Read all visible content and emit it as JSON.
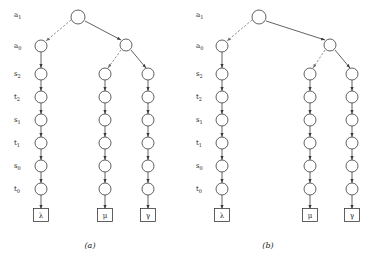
{
  "figure": {
    "panels": [
      {
        "id": "panel-a",
        "caption": "(a)",
        "caption_x": 90,
        "caption_y": 248,
        "origin_x": 0,
        "row_labels": [
          {
            "base": "a",
            "sub": "1",
            "x": 14,
            "y": 17
          },
          {
            "base": "a",
            "sub": "0",
            "x": 14,
            "y": 48
          },
          {
            "base": "s",
            "sub": "2",
            "x": 14,
            "y": 76
          },
          {
            "base": "t",
            "sub": "2",
            "x": 14,
            "y": 99
          },
          {
            "base": "s",
            "sub": "1",
            "x": 14,
            "y": 122
          },
          {
            "base": "t",
            "sub": "1",
            "x": 14,
            "y": 145
          },
          {
            "base": "s",
            "sub": "0",
            "x": 14,
            "y": 168
          },
          {
            "base": "t",
            "sub": "0",
            "x": 14,
            "y": 191
          }
        ],
        "nodes": [
          {
            "name": "root-node",
            "x": 78,
            "y": 17,
            "r": 7
          },
          {
            "name": "left-a0-node",
            "x": 41,
            "y": 46,
            "r": 6
          },
          {
            "name": "right-a0-node",
            "x": 126,
            "y": 45,
            "r": 6
          },
          {
            "name": "left-chain-node-s2",
            "x": 41,
            "y": 74,
            "r": 6
          },
          {
            "name": "left-chain-node-t2",
            "x": 41,
            "y": 97,
            "r": 6
          },
          {
            "name": "left-chain-node-s1",
            "x": 41,
            "y": 120,
            "r": 6
          },
          {
            "name": "left-chain-node-t1",
            "x": 41,
            "y": 143,
            "r": 6
          },
          {
            "name": "left-chain-node-s0",
            "x": 41,
            "y": 166,
            "r": 6
          },
          {
            "name": "left-chain-node-t0",
            "x": 41,
            "y": 189,
            "r": 6
          },
          {
            "name": "mid-chain-node-s2",
            "x": 105,
            "y": 74,
            "r": 6
          },
          {
            "name": "mid-chain-node-t2",
            "x": 105,
            "y": 97,
            "r": 6
          },
          {
            "name": "mid-chain-node-s1",
            "x": 105,
            "y": 120,
            "r": 6
          },
          {
            "name": "mid-chain-node-t1",
            "x": 105,
            "y": 143,
            "r": 6
          },
          {
            "name": "mid-chain-node-s0",
            "x": 105,
            "y": 166,
            "r": 6
          },
          {
            "name": "mid-chain-node-t0",
            "x": 105,
            "y": 189,
            "r": 6
          },
          {
            "name": "right-chain-node-s2",
            "x": 148,
            "y": 74,
            "r": 6
          },
          {
            "name": "right-chain-node-t2",
            "x": 148,
            "y": 97,
            "r": 6
          },
          {
            "name": "right-chain-node-s1",
            "x": 148,
            "y": 120,
            "r": 6
          },
          {
            "name": "right-chain-node-t1",
            "x": 148,
            "y": 143,
            "r": 6
          },
          {
            "name": "right-chain-node-s0",
            "x": 148,
            "y": 166,
            "r": 6
          },
          {
            "name": "right-chain-node-t0",
            "x": 148,
            "y": 189,
            "r": 6
          }
        ],
        "terminals": [
          {
            "name": "terminal-lambda",
            "label": "λ",
            "x": 41,
            "y": 215,
            "w": 15,
            "h": 13
          },
          {
            "name": "terminal-mu",
            "label": "μ",
            "x": 105,
            "y": 215,
            "w": 15,
            "h": 13
          },
          {
            "name": "terminal-gamma",
            "label": "γ",
            "x": 148,
            "y": 215,
            "w": 15,
            "h": 13
          }
        ],
        "edges": [
          {
            "name": "edge-root-to-left-a0",
            "style": "dashed",
            "x1": 71,
            "y1": 20,
            "x2": 46,
            "y2": 41
          },
          {
            "name": "edge-root-to-right-a0",
            "style": "solid",
            "x1": 85,
            "y1": 21,
            "x2": 121,
            "y2": 40
          },
          {
            "name": "edge-right-a0-to-mid",
            "style": "dashed",
            "x1": 121,
            "y1": 50,
            "x2": 108,
            "y2": 68
          },
          {
            "name": "edge-right-a0-to-right",
            "style": "solid",
            "x1": 131,
            "y1": 50,
            "x2": 146,
            "y2": 68
          }
        ],
        "chain_edges": [
          {
            "name": "chain-edge",
            "x": 41,
            "y1": 52,
            "y2": 68
          },
          {
            "name": "chain-edge",
            "x": 41,
            "y1": 80,
            "y2": 91
          },
          {
            "name": "chain-edge",
            "x": 41,
            "y1": 103,
            "y2": 114
          },
          {
            "name": "chain-edge",
            "x": 41,
            "y1": 126,
            "y2": 137
          },
          {
            "name": "chain-edge",
            "x": 41,
            "y1": 149,
            "y2": 160
          },
          {
            "name": "chain-edge",
            "x": 41,
            "y1": 172,
            "y2": 183
          },
          {
            "name": "chain-edge",
            "x": 41,
            "y1": 195,
            "y2": 209
          },
          {
            "name": "chain-edge",
            "x": 105,
            "y1": 80,
            "y2": 91
          },
          {
            "name": "chain-edge",
            "x": 105,
            "y1": 103,
            "y2": 114
          },
          {
            "name": "chain-edge",
            "x": 105,
            "y1": 126,
            "y2": 137
          },
          {
            "name": "chain-edge",
            "x": 105,
            "y1": 149,
            "y2": 160
          },
          {
            "name": "chain-edge",
            "x": 105,
            "y1": 172,
            "y2": 183
          },
          {
            "name": "chain-edge",
            "x": 105,
            "y1": 195,
            "y2": 209
          },
          {
            "name": "chain-edge",
            "x": 148,
            "y1": 80,
            "y2": 91
          },
          {
            "name": "chain-edge",
            "x": 148,
            "y1": 103,
            "y2": 114
          },
          {
            "name": "chain-edge",
            "x": 148,
            "y1": 126,
            "y2": 137
          },
          {
            "name": "chain-edge",
            "x": 148,
            "y1": 149,
            "y2": 160
          },
          {
            "name": "chain-edge",
            "x": 148,
            "y1": 172,
            "y2": 183
          },
          {
            "name": "chain-edge",
            "x": 148,
            "y1": 195,
            "y2": 209
          }
        ]
      },
      {
        "id": "panel-b",
        "caption": "(b)",
        "caption_x": 268,
        "caption_y": 248,
        "origin_x": 186,
        "row_labels": [
          {
            "base": "a",
            "sub": "1",
            "x": 196,
            "y": 17
          },
          {
            "base": "a",
            "sub": "0",
            "x": 196,
            "y": 48
          },
          {
            "base": "s",
            "sub": "2",
            "x": 196,
            "y": 76
          },
          {
            "base": "t",
            "sub": "2",
            "x": 196,
            "y": 99
          },
          {
            "base": "s",
            "sub": "1",
            "x": 196,
            "y": 122
          },
          {
            "base": "t",
            "sub": "1",
            "x": 196,
            "y": 145
          },
          {
            "base": "s",
            "sub": "0",
            "x": 196,
            "y": 168
          },
          {
            "base": "t",
            "sub": "0",
            "x": 196,
            "y": 191
          }
        ],
        "nodes": [
          {
            "name": "root-node",
            "x": 259,
            "y": 17,
            "r": 7
          },
          {
            "name": "left-a0-node",
            "x": 222,
            "y": 46,
            "r": 6
          },
          {
            "name": "right-a0-node",
            "x": 330,
            "y": 45,
            "r": 6
          },
          {
            "name": "left-chain-node-s2",
            "x": 222,
            "y": 74,
            "r": 6
          },
          {
            "name": "left-chain-node-t2",
            "x": 222,
            "y": 97,
            "r": 6
          },
          {
            "name": "left-chain-node-s1",
            "x": 222,
            "y": 120,
            "r": 6
          },
          {
            "name": "left-chain-node-t1",
            "x": 222,
            "y": 143,
            "r": 6
          },
          {
            "name": "left-chain-node-s0",
            "x": 222,
            "y": 166,
            "r": 6
          },
          {
            "name": "left-chain-node-t0",
            "x": 222,
            "y": 189,
            "r": 6
          },
          {
            "name": "mid-chain-node-s2",
            "x": 310,
            "y": 74,
            "r": 6
          },
          {
            "name": "mid-chain-node-t2",
            "x": 310,
            "y": 97,
            "r": 6
          },
          {
            "name": "mid-chain-node-s1",
            "x": 310,
            "y": 120,
            "r": 6
          },
          {
            "name": "mid-chain-node-t1",
            "x": 310,
            "y": 143,
            "r": 6
          },
          {
            "name": "mid-chain-node-s0",
            "x": 310,
            "y": 166,
            "r": 6
          },
          {
            "name": "mid-chain-node-t0",
            "x": 310,
            "y": 189,
            "r": 6
          },
          {
            "name": "right-chain-node-s2",
            "x": 352,
            "y": 74,
            "r": 6
          },
          {
            "name": "right-chain-node-t2",
            "x": 352,
            "y": 97,
            "r": 6
          },
          {
            "name": "right-chain-node-s1",
            "x": 352,
            "y": 120,
            "r": 6
          },
          {
            "name": "right-chain-node-t1",
            "x": 352,
            "y": 143,
            "r": 6
          },
          {
            "name": "right-chain-node-s0",
            "x": 352,
            "y": 166,
            "r": 6
          },
          {
            "name": "right-chain-node-t0",
            "x": 352,
            "y": 189,
            "r": 6
          }
        ],
        "terminals": [
          {
            "name": "terminal-lambda",
            "label": "λ",
            "x": 222,
            "y": 215,
            "w": 15,
            "h": 13
          },
          {
            "name": "terminal-mu",
            "label": "μ",
            "x": 310,
            "y": 215,
            "w": 15,
            "h": 13
          },
          {
            "name": "terminal-gamma",
            "label": "γ",
            "x": 352,
            "y": 215,
            "w": 15,
            "h": 13
          }
        ],
        "edges": [
          {
            "name": "edge-root-to-left-a0",
            "style": "dashed",
            "x1": 252,
            "y1": 20,
            "x2": 227,
            "y2": 41
          },
          {
            "name": "edge-root-to-right-a0",
            "style": "solid",
            "x1": 266,
            "y1": 21,
            "x2": 325,
            "y2": 40
          },
          {
            "name": "edge-right-a0-to-mid",
            "style": "dashed",
            "x1": 325,
            "y1": 50,
            "x2": 313,
            "y2": 68
          },
          {
            "name": "edge-right-a0-to-right",
            "style": "solid",
            "x1": 335,
            "y1": 50,
            "x2": 350,
            "y2": 68
          }
        ],
        "chain_edges": [
          {
            "name": "chain-edge",
            "x": 222,
            "y1": 52,
            "y2": 68
          },
          {
            "name": "chain-edge",
            "x": 222,
            "y1": 80,
            "y2": 91
          },
          {
            "name": "chain-edge",
            "x": 222,
            "y1": 103,
            "y2": 114
          },
          {
            "name": "chain-edge",
            "x": 222,
            "y1": 126,
            "y2": 137
          },
          {
            "name": "chain-edge",
            "x": 222,
            "y1": 149,
            "y2": 160
          },
          {
            "name": "chain-edge",
            "x": 222,
            "y1": 172,
            "y2": 183
          },
          {
            "name": "chain-edge",
            "x": 222,
            "y1": 195,
            "y2": 209
          },
          {
            "name": "chain-edge",
            "x": 310,
            "y1": 80,
            "y2": 91
          },
          {
            "name": "chain-edge",
            "x": 310,
            "y1": 103,
            "y2": 114
          },
          {
            "name": "chain-edge",
            "x": 310,
            "y1": 126,
            "y2": 137
          },
          {
            "name": "chain-edge",
            "x": 310,
            "y1": 149,
            "y2": 160
          },
          {
            "name": "chain-edge",
            "x": 310,
            "y1": 172,
            "y2": 183
          },
          {
            "name": "chain-edge",
            "x": 310,
            "y1": 195,
            "y2": 209
          },
          {
            "name": "chain-edge",
            "x": 352,
            "y1": 80,
            "y2": 91
          },
          {
            "name": "chain-edge",
            "x": 352,
            "y1": 103,
            "y2": 114
          },
          {
            "name": "chain-edge",
            "x": 352,
            "y1": 126,
            "y2": 137
          },
          {
            "name": "chain-edge",
            "x": 352,
            "y1": 149,
            "y2": 160
          },
          {
            "name": "chain-edge",
            "x": 352,
            "y1": 172,
            "y2": 183
          },
          {
            "name": "chain-edge",
            "x": 352,
            "y1": 195,
            "y2": 209
          }
        ]
      }
    ],
    "colors": {
      "stroke": "#3a3a3a",
      "dashed_stroke": "#6e6e6e",
      "text": "#1a1a1a",
      "background": "#ffffff"
    }
  }
}
